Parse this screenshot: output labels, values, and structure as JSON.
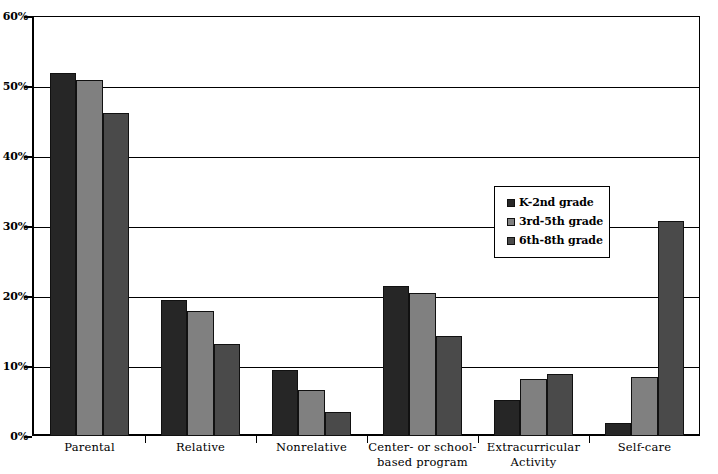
{
  "chart_data": {
    "type": "bar",
    "title": "",
    "subtitle": "",
    "xlabel": "",
    "ylabel": "",
    "ylim": [
      0,
      60
    ],
    "ytick_values": [
      0,
      10,
      20,
      30,
      40,
      50,
      60
    ],
    "ytick_labels": [
      "0%",
      "10%",
      "20%",
      "30%",
      "40%",
      "50%",
      "60%"
    ],
    "grid": true,
    "legend_position": "inside-right",
    "categories": [
      "Parental",
      "Relative",
      "Nonrelative",
      "Center- or school-\nbased program",
      "Extracurricular\nActivity",
      "Self-care"
    ],
    "series": [
      {
        "name": "K-2nd grade",
        "color": "#262626",
        "values": [
          51.8,
          19.5,
          9.5,
          21.4,
          5.1,
          1.9
        ]
      },
      {
        "name": "3rd-5th grade",
        "color": "#808080",
        "values": [
          50.8,
          17.9,
          6.6,
          20.4,
          8.2,
          8.4
        ]
      },
      {
        "name": "6th-8th grade",
        "color": "#4a4a4a",
        "values": [
          46.2,
          13.2,
          3.4,
          14.3,
          8.9,
          30.7
        ]
      }
    ]
  }
}
